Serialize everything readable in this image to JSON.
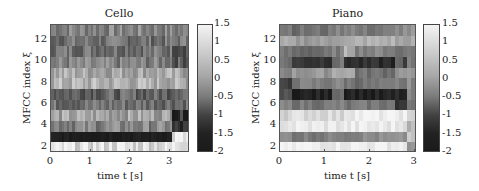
{
  "chart_data": [
    {
      "type": "heatmap",
      "title": "Cello",
      "xlabel": "time t [s]",
      "ylabel": "MFCC index ξ",
      "xlim": [
        0,
        3.5
      ],
      "ylim": [
        1.5,
        13.5
      ],
      "xticks": [
        "0",
        "1",
        "2",
        "3"
      ],
      "yticks": [
        "2",
        "4",
        "6",
        "8",
        "10",
        "12"
      ],
      "colorbar": {
        "ticks": [
          "1.5",
          "1",
          "0.5",
          "0",
          "-0.5",
          "-1",
          "-1.5",
          "-2"
        ],
        "range": [
          -2,
          1.5
        ],
        "colormap": "gray"
      },
      "rows_top_to_bottom": [
        {
          "index": 13,
          "level": -0.3,
          "end_level": -0.4
        },
        {
          "index": 12,
          "level": -0.6,
          "end_level": -0.5
        },
        {
          "index": 11,
          "level": -0.55,
          "end_level": -0.9
        },
        {
          "index": 10,
          "level": -0.4,
          "end_level": -0.9
        },
        {
          "index": 9,
          "level": 0.3,
          "end_level": 0.2
        },
        {
          "index": 8,
          "level": 0.4,
          "end_level": 0.3
        },
        {
          "index": 7,
          "level": -0.8,
          "end_level": -0.5
        },
        {
          "index": 6,
          "level": -0.6,
          "end_level": -0.6
        },
        {
          "index": 5,
          "level": 0.2,
          "end_level": -1.6
        },
        {
          "index": 4,
          "level": -0.3,
          "end_level": -1.7
        },
        {
          "index": 3,
          "level": -1.9,
          "end_level": 1.2
        },
        {
          "index": 2,
          "level": 1.1,
          "end_level": 1.4
        }
      ],
      "end_change_time": 3.1
    },
    {
      "type": "heatmap",
      "title": "Piano",
      "xlabel": "time t [s]",
      "ylabel": "MFCC index ξ",
      "xlim": [
        0,
        3.05
      ],
      "ylim": [
        1.5,
        13.5
      ],
      "xticks": [
        "0",
        "1",
        "2",
        "3"
      ],
      "yticks": [
        "2",
        "4",
        "6",
        "8",
        "10",
        "12"
      ],
      "colorbar": {
        "ticks": [
          "1.5",
          "1",
          "0.5",
          "0",
          "-0.5",
          "-1",
          "-1.5",
          "-2"
        ],
        "range": [
          -2,
          1.5
        ],
        "colormap": "gray"
      },
      "rows_top_to_bottom": [
        {
          "index": 13,
          "segments": [
            -0.4,
            -0.6,
            -0.3,
            -0.2,
            -0.5,
            -0.2,
            -0.1,
            -0.1
          ]
        },
        {
          "index": 12,
          "segments": [
            0.2,
            0.1,
            0.3,
            0.2,
            0.4,
            0.2,
            0.1,
            0.3
          ]
        },
        {
          "index": 11,
          "segments": [
            -0.6,
            -0.7,
            -0.4,
            0.4,
            -0.3,
            -0.7,
            -0.5,
            -0.3
          ]
        },
        {
          "index": 10,
          "segments": [
            -0.6,
            -1.5,
            -0.6,
            -1.6,
            -1.7,
            -0.9,
            -1.6,
            -0.5
          ]
        },
        {
          "index": 9,
          "segments": [
            -0.2,
            0.0,
            0.4,
            0.3,
            -0.6,
            0.0,
            0.2,
            0.0
          ]
        },
        {
          "index": 8,
          "segments": [
            -1.5,
            -0.4,
            -0.3,
            -0.5,
            -0.6,
            -0.4,
            -0.6,
            -0.2
          ]
        },
        {
          "index": 7,
          "segments": [
            -1.2,
            -1.9,
            -0.6,
            -1.8,
            -1.9,
            -1.8,
            -1.9,
            -0.4
          ]
        },
        {
          "index": 6,
          "segments": [
            -0.4,
            -0.5,
            -0.4,
            -0.6,
            -0.5,
            -1.7,
            -1.5,
            -0.4
          ]
        },
        {
          "index": 5,
          "segments": [
            1.0,
            1.1,
            1.0,
            1.4,
            1.4,
            1.4,
            1.4,
            0.8
          ]
        },
        {
          "index": 4,
          "segments": [
            1.3,
            1.3,
            1.3,
            1.3,
            1.3,
            1.3,
            1.3,
            0.5
          ]
        },
        {
          "index": 3,
          "segments": [
            -0.2,
            -0.4,
            -0.2,
            -0.3,
            -0.2,
            -0.2,
            -0.1,
            0.8
          ]
        },
        {
          "index": 2,
          "segments": [
            1.4,
            1.4,
            1.4,
            1.4,
            1.4,
            1.4,
            1.4,
            -0.2
          ]
        }
      ]
    }
  ],
  "panels": {
    "cello": {
      "title": "Cello",
      "xlabel": "time t [s]",
      "ylabel": "MFCC index ξ"
    },
    "piano": {
      "title": "Piano",
      "xlabel": "time t [s]",
      "ylabel": "MFCC index ξ"
    }
  }
}
